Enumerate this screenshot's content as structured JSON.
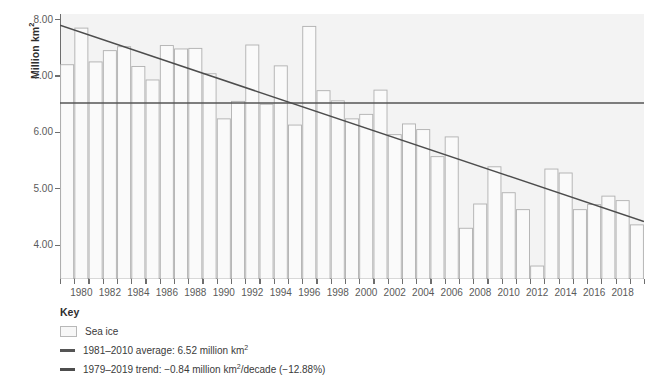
{
  "axis": {
    "ylabel": "Million km",
    "ylabel_sup": "2",
    "yticks": [
      "8.00",
      "7.00",
      "6.00",
      "5.00",
      "4.00"
    ],
    "ymin": 3.4,
    "ymax": 8.1
  },
  "legend": {
    "title": "Key",
    "items": [
      {
        "marker": "box",
        "label": "Sea ice",
        "sup": ""
      },
      {
        "marker": "line",
        "label": "1981–2010 average: 6.52 million km",
        "sup": "2",
        "tail": ""
      },
      {
        "marker": "line",
        "label": "1979–2019  trend: −0.84 million km",
        "sup": "2",
        "tail": "/decade (−12.88%)"
      }
    ]
  },
  "colors": {
    "bar_fill": "#fafafa",
    "bar_stroke": "#b0b0b0",
    "average_line": "#555555",
    "trend_line": "#4d4d4d",
    "axis": "#6e6e6e",
    "plot_bg": "#f3f3f3",
    "text": "#3a3a3a"
  },
  "chart_data": {
    "type": "bar",
    "title": "",
    "xlabel": "",
    "ylabel": "Million km2",
    "ylim": [
      3.4,
      8.1
    ],
    "grid": false,
    "legend_position": "below",
    "categories": [
      "1979",
      "1980",
      "1981",
      "1982",
      "1983",
      "1984",
      "1985",
      "1986",
      "1987",
      "1988",
      "1989",
      "1990",
      "1991",
      "1992",
      "1993",
      "1994",
      "1995",
      "1996",
      "1997",
      "1998",
      "1999",
      "2000",
      "2001",
      "2002",
      "2003",
      "2004",
      "2005",
      "2006",
      "2007",
      "2008",
      "2009",
      "2010",
      "2011",
      "2012",
      "2013",
      "2014",
      "2015",
      "2016",
      "2017",
      "2018",
      "2019"
    ],
    "xtick_labels": [
      "1980",
      "1982",
      "1984",
      "1986",
      "1988",
      "1990",
      "1992",
      "1994",
      "1996",
      "1998",
      "2000",
      "2002",
      "2004",
      "2006",
      "2008",
      "2010",
      "2012",
      "2014",
      "2016",
      "2018"
    ],
    "values": [
      7.2,
      7.85,
      7.25,
      7.45,
      7.52,
      7.17,
      6.93,
      7.54,
      7.48,
      7.49,
      7.04,
      6.24,
      6.55,
      7.55,
      6.5,
      7.18,
      6.13,
      7.88,
      6.74,
      6.56,
      6.24,
      6.32,
      6.75,
      5.96,
      6.15,
      6.05,
      5.57,
      5.92,
      4.3,
      4.73,
      5.39,
      4.93,
      4.63,
      3.63,
      5.35,
      5.28,
      4.63,
      4.72,
      4.87,
      4.79,
      4.36
    ],
    "reference_lines": [
      {
        "name": "1981–2010 average",
        "type": "horizontal",
        "value": 6.52
      },
      {
        "name": "1979–2019 trend",
        "type": "linear",
        "y_start": 7.9,
        "y_end": 4.42,
        "slope_per_decade": -0.84,
        "percent_per_decade": -12.88
      }
    ]
  }
}
